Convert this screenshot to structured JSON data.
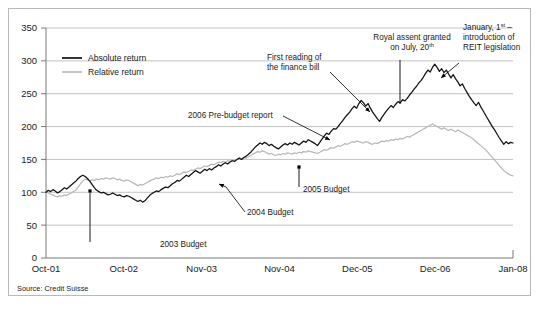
{
  "figure": {
    "source_note": "Source: Credit Suisse",
    "colors": {
      "absolute_series": "#111111",
      "relative_series": "#b8b8b8",
      "gridline": "#b2b2b2",
      "frame_border": "#b9b9b9",
      "background": "#ffffff"
    }
  },
  "legend": {
    "position": "top-left-inside",
    "entries": [
      {
        "label": "Absolute return",
        "color": "#111111"
      },
      {
        "label": "Relative return",
        "color": "#b8b8b8"
      }
    ]
  },
  "annotations": [
    {
      "id": "budget-2003",
      "lines": [
        "2003 Budget"
      ],
      "label_x": 160,
      "label_y": 247,
      "anchor": "start",
      "stem": {
        "x1": 90,
        "y1": 242,
        "x2": 90,
        "y2": 193
      },
      "marker": {
        "x": 90,
        "y": 191
      }
    },
    {
      "id": "budget-2004",
      "lines": [
        "2004 Budget"
      ],
      "label_x": 247,
      "label_y": 215,
      "anchor": "start",
      "leader": "M 245 212 L 226 187 L 219 184"
    },
    {
      "id": "budget-2005",
      "lines": [
        "2005 Budget"
      ],
      "label_x": 303,
      "label_y": 192,
      "anchor": "start",
      "stem": {
        "x1": 299,
        "y1": 187,
        "x2": 299,
        "y2": 168
      },
      "marker": {
        "x": 299,
        "y": 167
      }
    },
    {
      "id": "pre-budget-report-2006",
      "lines": [
        "2006 Pre-budget report"
      ],
      "label_x": 188,
      "label_y": 118,
      "anchor": "start",
      "leader": "M 283 116 L 330 140"
    },
    {
      "id": "first-reading-finance-bill",
      "lines": [
        "First reading of",
        "the finance bill"
      ],
      "label_x": 267,
      "label_y": 60,
      "anchor": "start",
      "leader": "M 330 72 L 370 112"
    },
    {
      "id": "royal-assent",
      "lines": [
        "Royal assent granted",
        "on July, 20th"
      ],
      "label_x": 412,
      "label_y": 40,
      "anchor": "middle",
      "superscript_last_line": "th",
      "stem": {
        "x1": 400,
        "y1": 60,
        "x2": 400,
        "y2": 104
      }
    },
    {
      "id": "reit-legislation",
      "lines": [
        "January, 1st –",
        "introduction of",
        "REIT legislation"
      ],
      "label_x": 463,
      "label_y": 30,
      "anchor": "start",
      "superscript_first_line": "st",
      "leader": "M 459 63 L 441 78"
    }
  ],
  "chart_data": {
    "type": "line",
    "title": "",
    "subtitle": "",
    "xlabel": "",
    "ylabel": "",
    "grid": true,
    "legend_position": "top-left",
    "ylim": [
      0,
      350
    ],
    "ytick_labels": [
      "0",
      "50",
      "100",
      "150",
      "200",
      "250",
      "300",
      "350"
    ],
    "ytick_values": [
      0,
      50,
      100,
      150,
      200,
      250,
      300,
      350
    ],
    "xtick_labels": [
      "Oct-01",
      "Oct-02",
      "Nov-03",
      "Nov-04",
      "Dec-05",
      "Dec-06",
      "Jan-08"
    ],
    "xtick_positions": [
      0,
      1,
      2,
      3,
      4,
      5,
      6
    ],
    "xlim": [
      0,
      6
    ],
    "series": [
      {
        "name": "Absolute return",
        "color": "#111111",
        "values": [
          100,
          103,
          101,
          104,
          102,
          99,
          101,
          104,
          107,
          105,
          108,
          111,
          114,
          117,
          121,
          124,
          126,
          124,
          121,
          117,
          112,
          107,
          103,
          101,
          99,
          100,
          98,
          96,
          97,
          99,
          97,
          95,
          96,
          94,
          93,
          95,
          94,
          92,
          90,
          88,
          86,
          88,
          85,
          87,
          91,
          95,
          98,
          100,
          102,
          101,
          104,
          106,
          108,
          107,
          110,
          113,
          115,
          118,
          117,
          120,
          123,
          126,
          124,
          127,
          130,
          133,
          131,
          129,
          132,
          135,
          133,
          136,
          134,
          137,
          139,
          142,
          140,
          143,
          145,
          143,
          146,
          148,
          147,
          150,
          152,
          150,
          153,
          155,
          158,
          161,
          165,
          169,
          172,
          175,
          173,
          176,
          174,
          171,
          173,
          170,
          168,
          166,
          169,
          172,
          174,
          172,
          175,
          173,
          176,
          174,
          172,
          175,
          178,
          176,
          180,
          178,
          176,
          174,
          171,
          176,
          181,
          186,
          190,
          188,
          193,
          197,
          196,
          200,
          205,
          209,
          214,
          218,
          222,
          227,
          231,
          228,
          235,
          240,
          236,
          231,
          235,
          228,
          222,
          217,
          212,
          208,
          214,
          219,
          224,
          228,
          232,
          229,
          234,
          238,
          236,
          241,
          239,
          243,
          248,
          252,
          257,
          261,
          266,
          270,
          275,
          281,
          286,
          283,
          290,
          295,
          290,
          284,
          288,
          282,
          286,
          280,
          274,
          279,
          273,
          268,
          262,
          265,
          258,
          252,
          246,
          241,
          236,
          232,
          237,
          230,
          224,
          218,
          212,
          206,
          200,
          195,
          189,
          183,
          178,
          173,
          177,
          174,
          176,
          175
        ]
      },
      {
        "name": "Relative return",
        "color": "#b8b8b8",
        "values": [
          100,
          99,
          97,
          96,
          94,
          93,
          95,
          94,
          96,
          95,
          97,
          99,
          101,
          104,
          108,
          113,
          117,
          120,
          119,
          117,
          119,
          118,
          120,
          119,
          121,
          120,
          122,
          121,
          120,
          122,
          121,
          119,
          120,
          118,
          117,
          119,
          118,
          116,
          114,
          112,
          110,
          112,
          111,
          113,
          115,
          117,
          119,
          120,
          122,
          121,
          123,
          122,
          124,
          123,
          125,
          124,
          126,
          128,
          127,
          129,
          131,
          130,
          132,
          134,
          133,
          135,
          137,
          136,
          138,
          140,
          139,
          141,
          143,
          142,
          144,
          146,
          145,
          147,
          146,
          148,
          147,
          149,
          148,
          150,
          152,
          151,
          153,
          152,
          154,
          156,
          158,
          160,
          162,
          161,
          163,
          162,
          160,
          158,
          159,
          157,
          156,
          158,
          157,
          159,
          158,
          160,
          159,
          158,
          160,
          159,
          161,
          160,
          162,
          161,
          163,
          162,
          161,
          160,
          159,
          161,
          163,
          165,
          164,
          166,
          168,
          167,
          169,
          171,
          170,
          172,
          174,
          173,
          175,
          177,
          176,
          178,
          177,
          176,
          175,
          177,
          176,
          174,
          173,
          175,
          174,
          176,
          178,
          177,
          179,
          178,
          180,
          179,
          181,
          180,
          182,
          181,
          183,
          185,
          184,
          186,
          188,
          190,
          192,
          194,
          196,
          198,
          200,
          202,
          204,
          202,
          200,
          198,
          196,
          198,
          196,
          194,
          196,
          194,
          192,
          195,
          193,
          191,
          189,
          187,
          185,
          183,
          180,
          177,
          174,
          171,
          168,
          165,
          161,
          157,
          153,
          149,
          145,
          141,
          137,
          133,
          130,
          128,
          126,
          125
        ]
      }
    ]
  }
}
